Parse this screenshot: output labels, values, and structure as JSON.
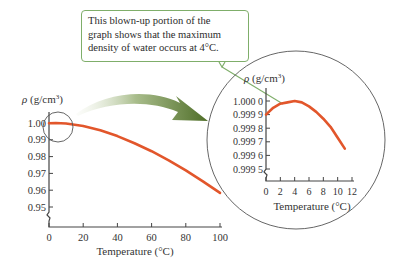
{
  "callout": {
    "lines": [
      "This blown-up portion of the",
      "graph shows that the maximum",
      "density of water occurs at 4°C."
    ]
  },
  "colors": {
    "curve": "#e2562b",
    "axis": "#444444",
    "callout_border": "#7fae6a",
    "arrow_dark": "#4f6e28",
    "arrow_light": "#dfe8d2"
  },
  "chart_data": [
    {
      "type": "line",
      "title": "",
      "xlabel": "Temperature (°C)",
      "ylabel": "ρ (g/cm³)",
      "xlim": [
        0,
        100
      ],
      "ylim": [
        0.95,
        1.0
      ],
      "x_ticks": [
        0,
        20,
        40,
        60,
        80,
        100
      ],
      "y_ticks": [
        "1.00",
        "0.99",
        "0.98",
        "0.97",
        "0.96",
        "0.95"
      ],
      "axis_break": "y",
      "grid": false,
      "series": [
        {
          "name": "Density of water",
          "x": [
            0,
            4,
            10,
            20,
            30,
            40,
            50,
            60,
            70,
            80,
            90,
            100
          ],
          "y": [
            0.9999,
            1.0,
            0.9997,
            0.9982,
            0.9957,
            0.9922,
            0.988,
            0.9832,
            0.9778,
            0.9718,
            0.9653,
            0.9584
          ]
        }
      ],
      "annotations": [
        "circle highlighting region 0–12 °C near ρ = 1.00"
      ]
    },
    {
      "type": "line",
      "title": "Blown-up inset",
      "xlabel": "Temperature (°C)",
      "ylabel": "ρ (g/cm³)",
      "xlim": [
        0,
        12
      ],
      "ylim": [
        0.9995,
        1.0
      ],
      "x_ticks": [
        0,
        2,
        4,
        6,
        8,
        10,
        12
      ],
      "y_ticks": [
        "1.000 0",
        "0.999 9",
        "0.999 8",
        "0.999 7",
        "0.999 6",
        "0.999 5"
      ],
      "axis_break": "y",
      "grid": false,
      "series": [
        {
          "name": "Density of water (0–12 °C)",
          "x": [
            0,
            1,
            2,
            3,
            4,
            5,
            6,
            7,
            8,
            9,
            10,
            11
          ],
          "y": [
            0.9999,
            0.99995,
            0.99998,
            0.99999,
            1.0,
            0.99999,
            0.99996,
            0.99992,
            0.99987,
            0.99981,
            0.99973,
            0.99965
          ]
        }
      ]
    }
  ]
}
